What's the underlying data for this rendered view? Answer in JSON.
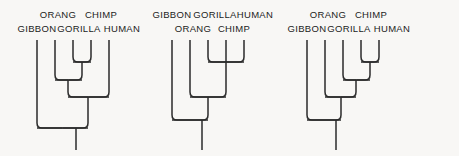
{
  "figure": {
    "background_color": "#f8f7f5",
    "line_color": "#2b2b2b",
    "text_color": "#1c1c1c"
  },
  "trees": [
    {
      "id": "tree-1",
      "topology": "(GIBBON,(ORANG,(GORILLA,CHIMP)),HUMAN)",
      "tips": [
        {
          "label": "GIBBON",
          "x": 37,
          "label_x": 37,
          "label_y": 32,
          "row": "lower"
        },
        {
          "label": "ORANG",
          "x": 55,
          "label_x": 58,
          "label_y": 18,
          "row": "upper"
        },
        {
          "label": "GORILLA",
          "x": 73,
          "label_x": 79,
          "label_y": 32,
          "row": "lower"
        },
        {
          "label": "CHIMP",
          "x": 91,
          "label_x": 101,
          "label_y": 18,
          "row": "upper"
        },
        {
          "label": "HUMAN",
          "x": 109,
          "label_x": 122,
          "label_y": 32,
          "row": "lower"
        }
      ],
      "nodes": [
        {
          "name": "gorilla-chimp",
          "y": 62,
          "children_x": [
            73,
            91
          ]
        },
        {
          "name": "orang-clade",
          "y": 80,
          "children_x": [
            55,
            82
          ]
        },
        {
          "name": "human-clade",
          "y": 97,
          "children_x": [
            68,
            109
          ]
        },
        {
          "name": "root",
          "y": 128,
          "children_x": [
            37,
            88
          ]
        }
      ],
      "root_stem": {
        "x": 76,
        "y_top": 128,
        "y_bottom": 150
      }
    },
    {
      "id": "tree-2",
      "topology": "(GIBBON,(ORANG,(GORILLA,CHIMP,HUMAN)))",
      "tips": [
        {
          "label": "GIBBON",
          "x": 172,
          "label_x": 172,
          "label_y": 18,
          "row": "upper"
        },
        {
          "label": "ORANG",
          "x": 190,
          "label_x": 193,
          "label_y": 32,
          "row": "lower"
        },
        {
          "label": "GORILLA",
          "x": 208,
          "label_x": 215,
          "label_y": 18,
          "row": "upper"
        },
        {
          "label": "CHIMP",
          "x": 226,
          "label_x": 234,
          "label_y": 32,
          "row": "lower"
        },
        {
          "label": "HUMAN",
          "x": 244,
          "label_x": 255,
          "label_y": 18,
          "row": "upper"
        }
      ],
      "nodes": [
        {
          "name": "african-ape-trifurcation",
          "y": 62,
          "children_x": [
            208,
            226,
            244
          ]
        },
        {
          "name": "orang-clade",
          "y": 97,
          "children_x": [
            190,
            226
          ]
        },
        {
          "name": "root",
          "y": 120,
          "children_x": [
            172,
            208
          ]
        }
      ],
      "root_stem": {
        "x": 202,
        "y_top": 120,
        "y_bottom": 150
      }
    },
    {
      "id": "tree-3",
      "topology": "(GIBBON,(ORANG,(GORILLA,(CHIMP,HUMAN))))",
      "tips": [
        {
          "label": "GIBBON",
          "x": 307,
          "label_x": 307,
          "label_y": 32,
          "row": "lower"
        },
        {
          "label": "ORANG",
          "x": 325,
          "label_x": 328,
          "label_y": 18,
          "row": "upper"
        },
        {
          "label": "GORILLA",
          "x": 343,
          "label_x": 349,
          "label_y": 32,
          "row": "lower"
        },
        {
          "label": "CHIMP",
          "x": 361,
          "label_x": 371,
          "label_y": 18,
          "row": "upper"
        },
        {
          "label": "HUMAN",
          "x": 379,
          "label_x": 392,
          "label_y": 32,
          "row": "lower"
        }
      ],
      "nodes": [
        {
          "name": "chimp-human",
          "y": 62,
          "children_x": [
            361,
            379
          ]
        },
        {
          "name": "gorilla-clade",
          "y": 80,
          "children_x": [
            343,
            370
          ]
        },
        {
          "name": "orang-clade",
          "y": 97,
          "children_x": [
            325,
            356
          ]
        },
        {
          "name": "root",
          "y": 120,
          "children_x": [
            307,
            341
          ]
        }
      ],
      "root_stem": {
        "x": 336,
        "y_top": 120,
        "y_bottom": 150
      }
    }
  ],
  "tip_line_top": 40,
  "corner_radius": 5
}
